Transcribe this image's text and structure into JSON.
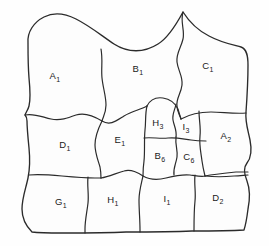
{
  "diagram": {
    "type": "labeled-region-map",
    "background_color": "#fefefe",
    "line_color": "#2b2b2b",
    "cell_count": 13,
    "cells": [
      {
        "id": "A1",
        "base": "A",
        "sub": "1",
        "row": "top",
        "x": 55,
        "y": 79
      },
      {
        "id": "B1",
        "base": "B",
        "sub": "1",
        "row": "top",
        "x": 138,
        "y": 72
      },
      {
        "id": "C1",
        "base": "C",
        "sub": "1",
        "row": "top",
        "x": 208,
        "y": 69
      },
      {
        "id": "D1",
        "base": "D",
        "sub": "1",
        "row": "middle",
        "x": 65,
        "y": 148
      },
      {
        "id": "E1",
        "base": "E",
        "sub": "1",
        "row": "middle",
        "x": 120,
        "y": 143
      },
      {
        "id": "H3",
        "base": "H",
        "sub": "3",
        "row": "middle",
        "x": 158,
        "y": 126
      },
      {
        "id": "I3",
        "base": "I",
        "sub": "3",
        "row": "middle",
        "x": 186,
        "y": 130
      },
      {
        "id": "A2",
        "base": "A",
        "sub": "2",
        "row": "middle",
        "x": 226,
        "y": 139
      },
      {
        "id": "B6",
        "base": "B",
        "sub": "6",
        "row": "middle",
        "x": 160,
        "y": 159
      },
      {
        "id": "C6",
        "base": "C",
        "sub": "6",
        "row": "middle",
        "x": 189,
        "y": 160
      },
      {
        "id": "G1",
        "base": "G",
        "sub": "1",
        "row": "bottom",
        "x": 61,
        "y": 205
      },
      {
        "id": "H1",
        "base": "H",
        "sub": "1",
        "row": "bottom",
        "x": 113,
        "y": 203
      },
      {
        "id": "I1",
        "base": "I",
        "sub": "1",
        "row": "bottom",
        "x": 167,
        "y": 202
      },
      {
        "id": "D2",
        "base": "D",
        "sub": "2",
        "row": "bottom",
        "x": 218,
        "y": 201
      }
    ]
  }
}
